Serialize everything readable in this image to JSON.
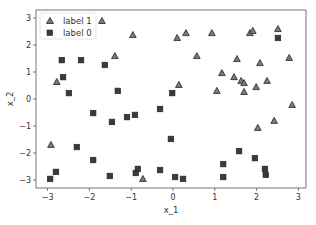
{
  "chart_data": {
    "type": "scatter",
    "title": "",
    "xlabel": "x_1",
    "ylabel": "x_2",
    "xlim": [
      -3.3,
      3.15
    ],
    "ylim": [
      -3.3,
      3.3
    ],
    "xticks": [
      -3,
      -2,
      -1,
      0,
      1,
      2,
      3
    ],
    "yticks": [
      -3,
      -2,
      -1,
      0,
      1,
      2,
      3
    ],
    "xtick_labels": [
      "−3",
      "−2",
      "−1",
      "0",
      "1",
      "2",
      "3"
    ],
    "ytick_labels": [
      "−3",
      "−2",
      "−1",
      "0",
      "1",
      "2",
      "3"
    ],
    "grid": false,
    "legend_position": "upper left",
    "series": [
      {
        "name": "label 1",
        "marker": "triangle",
        "color": "#7a7a7a",
        "edgecolor": "#333333",
        "points": [
          [
            -2.78,
            0.63
          ],
          [
            -1.7,
            2.89
          ],
          [
            -0.96,
            2.37
          ],
          [
            -1.39,
            1.59
          ],
          [
            0.31,
            2.44
          ],
          [
            0.1,
            2.26
          ],
          [
            0.93,
            2.44
          ],
          [
            1.84,
            2.44
          ],
          [
            1.91,
            2.52
          ],
          [
            2.51,
            2.59
          ],
          [
            0.57,
            1.59
          ],
          [
            1.53,
            1.48
          ],
          [
            2.08,
            1.33
          ],
          [
            2.78,
            1.52
          ],
          [
            1.17,
            0.96
          ],
          [
            1.46,
            0.81
          ],
          [
            1.63,
            0.67
          ],
          [
            1.7,
            0.59
          ],
          [
            2.25,
            0.67
          ],
          [
            1.99,
            0.44
          ],
          [
            0.14,
            0.52
          ],
          [
            1.05,
            0.3
          ],
          [
            1.7,
            0.26
          ],
          [
            2.85,
            -0.22
          ],
          [
            2.42,
            -0.81
          ],
          [
            2.03,
            -1.07
          ],
          [
            -2.92,
            -1.7
          ],
          [
            -0.72,
            -2.96
          ]
        ]
      },
      {
        "name": "label 0",
        "marker": "square",
        "color": "#3a3a3a",
        "edgecolor": "#222222",
        "points": [
          [
            -2.66,
            1.44
          ],
          [
            -2.2,
            1.44
          ],
          [
            -1.63,
            1.26
          ],
          [
            -2.63,
            0.81
          ],
          [
            -2.49,
            0.22
          ],
          [
            -1.32,
            0.3
          ],
          [
            2.51,
            2.26
          ],
          [
            -0.02,
            0.22
          ],
          [
            -0.31,
            -0.37
          ],
          [
            -1.91,
            -0.52
          ],
          [
            -1.46,
            -0.85
          ],
          [
            -1.1,
            -0.67
          ],
          [
            -0.91,
            -0.59
          ],
          [
            -2.3,
            -1.78
          ],
          [
            -1.91,
            -2.26
          ],
          [
            -2.8,
            -2.7
          ],
          [
            -2.94,
            -2.96
          ],
          [
            -1.51,
            -2.85
          ],
          [
            -0.84,
            -2.59
          ],
          [
            -0.89,
            -2.74
          ],
          [
            -0.31,
            -2.63
          ],
          [
            -0.05,
            -1.48
          ],
          [
            0.05,
            -2.89
          ],
          [
            0.24,
            -2.96
          ],
          [
            1.58,
            -1.93
          ],
          [
            1.96,
            -2.19
          ],
          [
            1.2,
            -2.41
          ],
          [
            1.2,
            -2.89
          ],
          [
            2.2,
            -2.59
          ],
          [
            2.22,
            -2.81
          ]
        ]
      }
    ]
  },
  "legend": {
    "items": [
      {
        "label": "label 1",
        "marker": "triangle"
      },
      {
        "label": "label 0",
        "marker": "square"
      }
    ]
  },
  "axes": {
    "xlabel": "x_1",
    "ylabel": "x_2"
  }
}
